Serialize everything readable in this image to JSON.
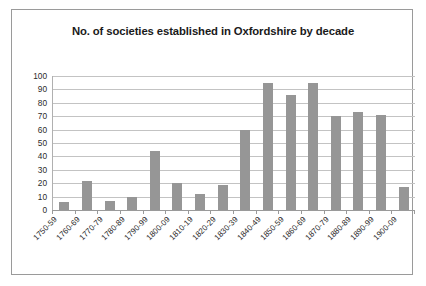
{
  "chart_data": {
    "type": "bar",
    "title": "No. of societies established in Oxfordshire by decade",
    "xlabel": "",
    "ylabel": "",
    "ylim": [
      0,
      100
    ],
    "ytick_step": 10,
    "yticks": [
      100,
      90,
      80,
      70,
      60,
      50,
      40,
      30,
      20,
      10,
      0
    ],
    "grid": true,
    "legend": false,
    "legend_position": "none",
    "bar_color": "#969696",
    "plot_background": "#ffffff",
    "gridline_color": "#c3c3c3",
    "categories": [
      "1750-59",
      "1760-69",
      "1770-79",
      "1780-89",
      "1790-99",
      "1800-09",
      "1810-19",
      "1820-29",
      "1830-39",
      "1840-49",
      "1850-59",
      "1860-69",
      "1870-79",
      "1880-89",
      "1890-99",
      "1900-09"
    ],
    "values": [
      6,
      22,
      7,
      10,
      44,
      20,
      12,
      19,
      60,
      95,
      86,
      95,
      70,
      73,
      71,
      17
    ]
  }
}
